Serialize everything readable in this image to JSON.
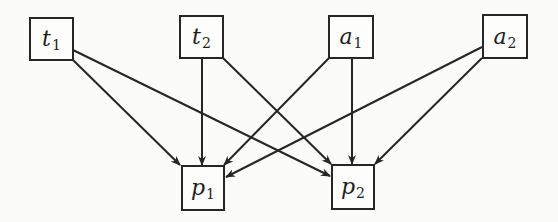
{
  "diagram": {
    "type": "directed-bipartite-graph",
    "colors": {
      "background": "#fbfbfa",
      "stroke": "#262626",
      "text": "#1e1e1e"
    },
    "nodes": [
      {
        "id": "t1",
        "symbol": "t",
        "subscript": "1",
        "row": "top",
        "box": {
          "x": 29,
          "y": 17,
          "w": 45,
          "h": 44
        }
      },
      {
        "id": "t2",
        "symbol": "t",
        "subscript": "2",
        "row": "top",
        "box": {
          "x": 179,
          "y": 15,
          "w": 45,
          "h": 44
        }
      },
      {
        "id": "a1",
        "symbol": "a",
        "subscript": "1",
        "row": "top",
        "box": {
          "x": 328,
          "y": 15,
          "w": 46,
          "h": 44
        }
      },
      {
        "id": "a2",
        "symbol": "a",
        "subscript": "2",
        "row": "top",
        "box": {
          "x": 482,
          "y": 14,
          "w": 46,
          "h": 45
        }
      },
      {
        "id": "p1",
        "symbol": "p",
        "subscript": "1",
        "row": "bottom",
        "box": {
          "x": 181,
          "y": 165,
          "w": 44,
          "h": 46
        }
      },
      {
        "id": "p2",
        "symbol": "p",
        "subscript": "2",
        "row": "bottom",
        "box": {
          "x": 331,
          "y": 164,
          "w": 44,
          "h": 46
        }
      }
    ],
    "edges": [
      {
        "from": "t1",
        "to": "p1",
        "x1": 73,
        "y1": 60,
        "x2": 180,
        "y2": 165
      },
      {
        "from": "t1",
        "to": "p2",
        "x1": 73,
        "y1": 50,
        "x2": 330,
        "y2": 176
      },
      {
        "from": "t2",
        "to": "p1",
        "x1": 202,
        "y1": 58,
        "x2": 202,
        "y2": 165
      },
      {
        "from": "t2",
        "to": "p2",
        "x1": 223,
        "y1": 58,
        "x2": 331,
        "y2": 164
      },
      {
        "from": "a1",
        "to": "p1",
        "x1": 329,
        "y1": 58,
        "x2": 224,
        "y2": 165
      },
      {
        "from": "a1",
        "to": "p2",
        "x1": 352,
        "y1": 58,
        "x2": 352,
        "y2": 164
      },
      {
        "from": "a2",
        "to": "p1",
        "x1": 482,
        "y1": 47,
        "x2": 226,
        "y2": 177
      },
      {
        "from": "a2",
        "to": "p2",
        "x1": 482,
        "y1": 58,
        "x2": 375,
        "y2": 164
      }
    ]
  }
}
